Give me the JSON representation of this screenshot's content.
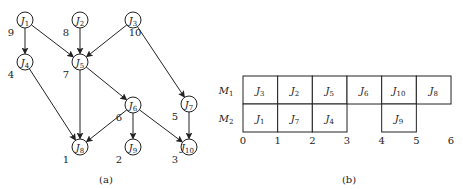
{
  "panel_a": {
    "caption": "(a)",
    "nodes": [
      {
        "id": "J1",
        "base": "J",
        "sub": "1",
        "weight": "9",
        "x": 25,
        "y": 20
      },
      {
        "id": "J2",
        "base": "J",
        "sub": "2",
        "weight": "8",
        "x": 80,
        "y": 20
      },
      {
        "id": "J3",
        "base": "J",
        "sub": "3",
        "weight": "10",
        "x": 133,
        "y": 20
      },
      {
        "id": "J4",
        "base": "J",
        "sub": "4",
        "weight": "4",
        "x": 25,
        "y": 62
      },
      {
        "id": "J5",
        "base": "J",
        "sub": "5",
        "weight": "7",
        "x": 80,
        "y": 62
      },
      {
        "id": "J6",
        "base": "J",
        "sub": "6",
        "weight": "6",
        "x": 133,
        "y": 105
      },
      {
        "id": "J7",
        "base": "J",
        "sub": "7",
        "weight": "5",
        "x": 189,
        "y": 104
      },
      {
        "id": "J8",
        "base": "J",
        "sub": "8",
        "weight": "1",
        "x": 80,
        "y": 147
      },
      {
        "id": "J9",
        "base": "J",
        "sub": "9",
        "weight": "2",
        "x": 133,
        "y": 147
      },
      {
        "id": "J10",
        "base": "J",
        "sub": "10",
        "weight": "3",
        "x": 189,
        "y": 147
      }
    ],
    "edges": [
      [
        "J1",
        "J4"
      ],
      [
        "J1",
        "J5"
      ],
      [
        "J2",
        "J5"
      ],
      [
        "J3",
        "J5"
      ],
      [
        "J3",
        "J7"
      ],
      [
        "J4",
        "J8"
      ],
      [
        "J5",
        "J8"
      ],
      [
        "J5",
        "J6"
      ],
      [
        "J6",
        "J8"
      ],
      [
        "J6",
        "J9"
      ],
      [
        "J6",
        "J10"
      ],
      [
        "J7",
        "J10"
      ]
    ]
  },
  "panel_b": {
    "caption": "(b)",
    "machines": [
      {
        "label": "M",
        "sub": "1",
        "jobs": [
          {
            "job": "J",
            "sub": "3",
            "start": 0,
            "end": 1
          },
          {
            "job": "J",
            "sub": "2",
            "start": 1,
            "end": 2
          },
          {
            "job": "J",
            "sub": "5",
            "start": 2,
            "end": 3
          },
          {
            "job": "J",
            "sub": "6",
            "start": 3,
            "end": 4
          },
          {
            "job": "J",
            "sub": "10",
            "start": 4,
            "end": 5
          },
          {
            "job": "J",
            "sub": "8",
            "start": 5,
            "end": 6
          }
        ]
      },
      {
        "label": "M",
        "sub": "2",
        "jobs": [
          {
            "job": "J",
            "sub": "1",
            "start": 0,
            "end": 1
          },
          {
            "job": "J",
            "sub": "7",
            "start": 1,
            "end": 2
          },
          {
            "job": "J",
            "sub": "4",
            "start": 2,
            "end": 3
          },
          {
            "job": "J",
            "sub": "9",
            "start": 4,
            "end": 5
          }
        ]
      }
    ],
    "ticks": [
      "0",
      "1",
      "2",
      "3",
      "4",
      "5",
      "6"
    ]
  }
}
